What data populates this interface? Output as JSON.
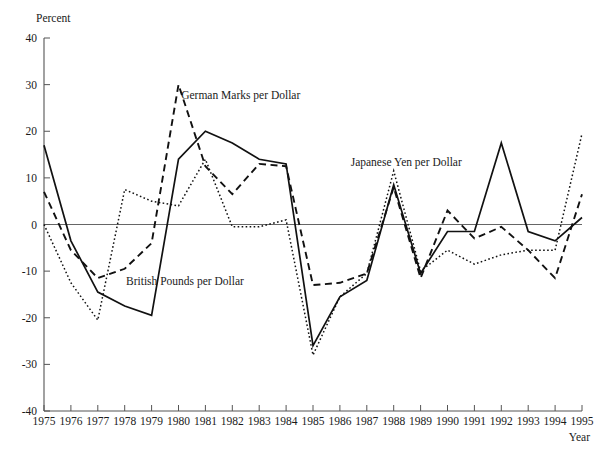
{
  "chart_data": {
    "type": "line",
    "title": "",
    "xlabel": "Year",
    "ylabel": "Percent",
    "xlim": [
      1975,
      1995
    ],
    "ylim": [
      -40,
      40
    ],
    "ytick_step": 10,
    "grid": false,
    "legend_position": "inline-annotations",
    "x": [
      1975,
      1976,
      1977,
      1978,
      1979,
      1980,
      1981,
      1982,
      1983,
      1984,
      1985,
      1986,
      1987,
      1988,
      1989,
      1990,
      1991,
      1992,
      1993,
      1994,
      1995
    ],
    "xticklabels": [
      "1975",
      "1976",
      "1977",
      "1978",
      "1979",
      "1980",
      "1981",
      "1982",
      "1983",
      "1984",
      "1985",
      "1986",
      "1987",
      "1988",
      "1989",
      "1990",
      "1991",
      "1992",
      "1993",
      "1994",
      "1995"
    ],
    "yticklabels": [
      "40",
      "30",
      "20",
      "10",
      "0",
      "-10",
      "-20",
      "-30",
      "-40"
    ],
    "yticks": [
      40,
      30,
      20,
      10,
      0,
      -10,
      -20,
      -30,
      -40
    ],
    "series": [
      {
        "name": "British Pounds per Dollar",
        "style": "solid",
        "label_x": 1978.05,
        "label_y": -13.0,
        "values": [
          17.0,
          -3.5,
          -14.5,
          -17.5,
          -19.5,
          14.0,
          20.0,
          17.5,
          14.0,
          13.0,
          -26.0,
          -15.5,
          -12.0,
          8.5,
          -10.5,
          -1.5,
          -1.5,
          17.5,
          -1.5,
          -3.5,
          1.5
        ]
      },
      {
        "name": "German Marks per Dollar",
        "style": "dashed",
        "label_x": 1980.1,
        "label_y": 27.0,
        "values": [
          7.0,
          -5.5,
          -11.5,
          -9.5,
          -4.0,
          30.0,
          12.5,
          6.5,
          13.0,
          12.5,
          -13.0,
          -12.5,
          -10.5,
          8.0,
          -11.5,
          3.0,
          -3.0,
          -0.5,
          -5.5,
          -11.5,
          6.5
        ]
      },
      {
        "name": "Japanese Yen per Dollar",
        "style": "dotted",
        "label_x": 1986.4,
        "label_y": 12.5,
        "values": [
          0.0,
          -12.5,
          -20.5,
          7.5,
          5.0,
          4.0,
          14.0,
          -0.5,
          -0.5,
          1.0,
          -28.0,
          -15.5,
          -10.5,
          11.5,
          -10.0,
          -5.5,
          -8.5,
          -6.5,
          -5.5,
          -5.5,
          19.5
        ]
      }
    ]
  },
  "axes": {
    "y_axis_title": "Percent",
    "x_axis_title": "Year"
  }
}
